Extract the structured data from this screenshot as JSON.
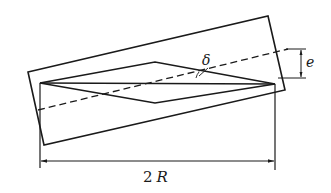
{
  "diagram": {
    "labels": {
      "angle": "δ",
      "offset": "e",
      "width_number": "2",
      "width_symbol": "R"
    },
    "elements": {
      "tilted_rectangle": "outer tilted rectangle",
      "rhombus": "rhombus/diamond shape",
      "horizontal_axis": "horizontal line through rhombus tips",
      "dashed_axis": "dashed inclined centerline",
      "dimension_2R": "horizontal dimension 2R",
      "dimension_e": "vertical offset dimension e"
    },
    "colors": {
      "stroke": "#1a1a1a",
      "background": "#ffffff"
    }
  }
}
